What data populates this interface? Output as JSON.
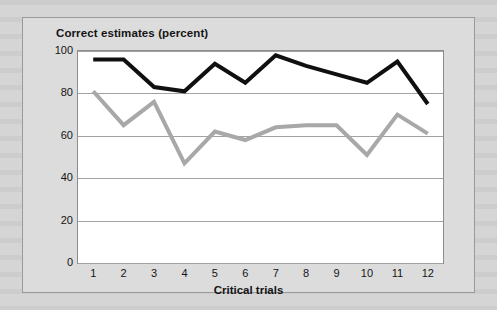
{
  "figure": {
    "title": "Correct estimates (percent)",
    "xaxis_label": "Critical trials"
  },
  "chart_data": {
    "type": "line",
    "title": "Correct estimates (percent)",
    "xlabel": "Critical trials",
    "ylabel": "Correct estimates (percent)",
    "categories": [
      "1",
      "2",
      "3",
      "4",
      "5",
      "6",
      "7",
      "8",
      "9",
      "10",
      "11",
      "12"
    ],
    "x": [
      1,
      2,
      3,
      4,
      5,
      6,
      7,
      8,
      9,
      10,
      11,
      12
    ],
    "ylim": [
      0,
      100
    ],
    "yticks": [
      0,
      20,
      40,
      60,
      80,
      100
    ],
    "ytick_labels": [
      "0",
      "20",
      "40",
      "60",
      "80",
      "100"
    ],
    "grid": true,
    "legend": "none",
    "series": [
      {
        "name": "black-series",
        "color": "#101010",
        "values": [
          96,
          96,
          83,
          81,
          94,
          85,
          98,
          93,
          89,
          85,
          95,
          75
        ]
      },
      {
        "name": "gray-series",
        "color": "#a8a8a8",
        "values": [
          81,
          65,
          76,
          47,
          62,
          58,
          64,
          65,
          65,
          51,
          70,
          61
        ]
      }
    ]
  }
}
